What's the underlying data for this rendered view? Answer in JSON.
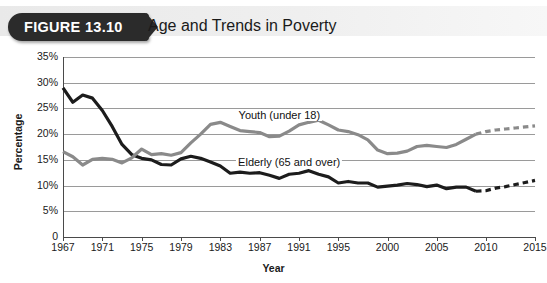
{
  "figure": {
    "badge": "FIGURE 13.10",
    "title": "Age and Trends in Poverty"
  },
  "chart_data": {
    "type": "line",
    "title": "Age and Trends in Poverty",
    "xlabel": "Year",
    "ylabel": "Percentage",
    "xlim": [
      1967,
      2015
    ],
    "ylim": [
      0,
      35
    ],
    "grid": true,
    "legend_position": "inline-annotation",
    "ytick_labels": [
      "0",
      "5%",
      "10%",
      "15%",
      "20%",
      "25%",
      "30%",
      "35%"
    ],
    "ytick_values": [
      0,
      5,
      10,
      15,
      20,
      25,
      30,
      35
    ],
    "xtick_labels": [
      "1967",
      "1971",
      "1975",
      "1979",
      "1983",
      "1987",
      "1991",
      "1995",
      "2000",
      "2005",
      "2010",
      "2015"
    ],
    "xtick_values": [
      1967,
      1971,
      1975,
      1979,
      1983,
      1987,
      1991,
      1995,
      2000,
      2005,
      2010,
      2015
    ],
    "annotations": [
      {
        "text": "Youth (under 18)",
        "x": 1989,
        "y": 23.5
      },
      {
        "text": "Elderly (65 and over)",
        "x": 1990,
        "y": 14.3
      }
    ],
    "series": [
      {
        "name": "Elderly (65 and over)",
        "color": "#1c1c1c",
        "solid_until": 2009,
        "projection_dashed": true,
        "x": [
          1967,
          1968,
          1969,
          1970,
          1971,
          1972,
          1973,
          1974,
          1975,
          1976,
          1977,
          1978,
          1979,
          1980,
          1981,
          1982,
          1983,
          1984,
          1985,
          1986,
          1987,
          1988,
          1989,
          1990,
          1991,
          1992,
          1993,
          1994,
          1995,
          1996,
          1997,
          1998,
          1999,
          2000,
          2001,
          2002,
          2003,
          2004,
          2005,
          2006,
          2007,
          2008,
          2009,
          2010,
          2011,
          2012,
          2013,
          2014,
          2015
        ],
        "y": [
          29.0,
          26.2,
          27.6,
          27.0,
          24.6,
          21.5,
          18.0,
          16.0,
          15.3,
          15.0,
          14.1,
          14.0,
          15.2,
          15.7,
          15.3,
          14.6,
          13.8,
          12.4,
          12.6,
          12.4,
          12.5,
          12.0,
          11.4,
          12.2,
          12.4,
          12.9,
          12.2,
          11.7,
          10.5,
          10.8,
          10.5,
          10.5,
          9.7,
          9.9,
          10.1,
          10.4,
          10.2,
          9.8,
          10.1,
          9.4,
          9.7,
          9.7,
          8.9,
          9.0,
          9.5,
          9.8,
          10.2,
          10.6,
          11.0
        ]
      },
      {
        "name": "Youth (under 18)",
        "color": "#8a8a8a",
        "solid_until": 2009,
        "projection_dashed": true,
        "x": [
          1967,
          1968,
          1969,
          1970,
          1971,
          1972,
          1973,
          1974,
          1975,
          1976,
          1977,
          1978,
          1979,
          1980,
          1981,
          1982,
          1983,
          1984,
          1985,
          1986,
          1987,
          1988,
          1989,
          1990,
          1991,
          1992,
          1993,
          1994,
          1995,
          1996,
          1997,
          1998,
          1999,
          2000,
          2001,
          2002,
          2003,
          2004,
          2005,
          2006,
          2007,
          2008,
          2009,
          2010,
          2011,
          2012,
          2013,
          2014,
          2015
        ],
        "y": [
          16.6,
          15.6,
          14.0,
          15.1,
          15.3,
          15.1,
          14.4,
          15.4,
          17.1,
          16.0,
          16.2,
          15.9,
          16.4,
          18.3,
          20.0,
          21.9,
          22.3,
          21.5,
          20.7,
          20.5,
          20.3,
          19.5,
          19.6,
          20.6,
          21.8,
          22.3,
          22.7,
          21.8,
          20.8,
          20.5,
          19.9,
          18.9,
          16.9,
          16.2,
          16.3,
          16.7,
          17.6,
          17.8,
          17.6,
          17.4,
          18.0,
          19.0,
          20.0,
          20.5,
          20.8,
          21.0,
          21.2,
          21.4,
          21.6
        ]
      }
    ]
  }
}
